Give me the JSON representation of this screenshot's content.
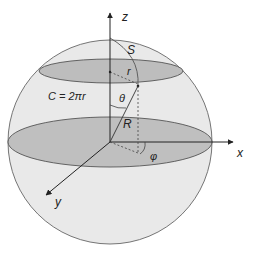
{
  "diagram": {
    "colors": {
      "sphere_fill": "#e8e8e8",
      "disk_fill": "#bdbdbd",
      "stroke": "#555555",
      "axis": "#222222"
    },
    "axes": {
      "z": "z",
      "x": "x",
      "y": "y"
    },
    "labels": {
      "arc": "S",
      "small_radius": "r",
      "circumference": "C = 2πr",
      "polar_angle": "θ",
      "radius": "R",
      "azimuth": "φ"
    }
  }
}
